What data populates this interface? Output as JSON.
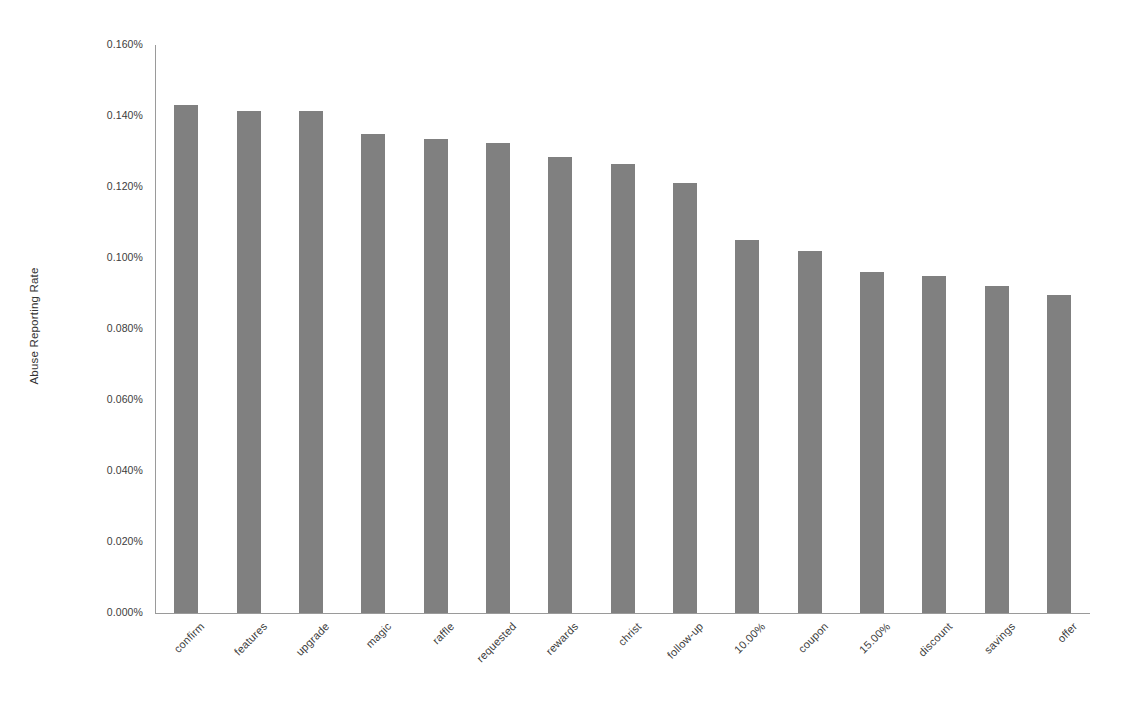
{
  "chart_data": {
    "type": "bar",
    "title": "",
    "subtitle": "",
    "xlabel": "",
    "ylabel": "Abuse Reporting Rate",
    "categories": [
      "confirm",
      "features",
      "upgrade",
      "magic",
      "raffle",
      "requested",
      "rewards",
      "christ",
      "follow-up",
      "10.00%",
      "coupon",
      "15.00%",
      "discount",
      "savings",
      "offer"
    ],
    "values": [
      0.143,
      0.1415,
      0.1415,
      0.135,
      0.1335,
      0.1325,
      0.1285,
      0.1265,
      0.121,
      0.105,
      0.102,
      0.096,
      0.095,
      0.092,
      0.0897
    ],
    "value_labels": [
      "0.143%",
      "0.1415%",
      "0.1415%",
      "0.135%",
      "0.1335%",
      "0.1325%",
      "0.1285%",
      "0.1265%",
      "0.121%",
      "0.105%",
      "0.102%",
      "0.096%",
      "0.095%",
      "0.092%",
      "0.0897%"
    ],
    "ylim": [
      0,
      0.16
    ],
    "ytick_values": [
      0.0,
      0.02,
      0.04,
      0.06,
      0.08,
      0.1,
      0.12,
      0.14,
      0.16
    ],
    "ytick_labels": [
      "0.000%",
      "0.020%",
      "0.040%",
      "0.060%",
      "0.080%",
      "0.100%",
      "0.120%",
      "0.140%",
      "0.160%"
    ],
    "grid": false,
    "legend": null,
    "legend_position": "none",
    "bar_color": "#808080",
    "axis_color": "#9a9a9a",
    "text_color": "#3c3c3c",
    "background_color": "#ffffff",
    "xtick_rotation": -45
  }
}
